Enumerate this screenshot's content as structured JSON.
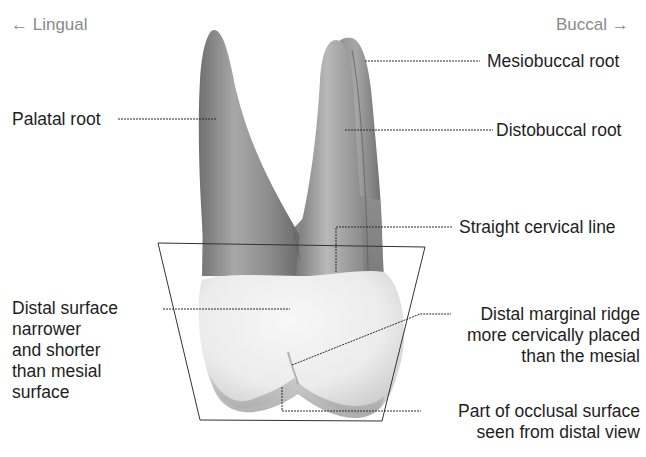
{
  "figure": {
    "direction_left": "← Lingual",
    "direction_right": "Buccal →"
  },
  "labels": {
    "mesiobuccal_root": "Mesiobuccal root",
    "palatal_root": "Palatal root",
    "distobuccal_root": "Distobuccal root",
    "straight_cervical_line": "Straight cervical line",
    "distal_surface": [
      "Distal surface",
      "narrower",
      "and shorter",
      "than mesial",
      "surface"
    ],
    "distal_marginal_ridge": [
      "Distal marginal ridge",
      "more cervically placed",
      "than the mesial"
    ],
    "occlusal_part": [
      "Part of occlusal surface",
      "seen from distal view"
    ]
  },
  "colors": {
    "root_dark": "#6e6e6e",
    "root_mid": "#9a9a9a",
    "root_light": "#c4c4c4",
    "crown_light": "#f2f2f2",
    "crown_shadow": "#bdbdbd",
    "leader_line": "#2a2a2a",
    "label_text": "#1e1e1e",
    "direction_text": "#8a8a8a"
  }
}
